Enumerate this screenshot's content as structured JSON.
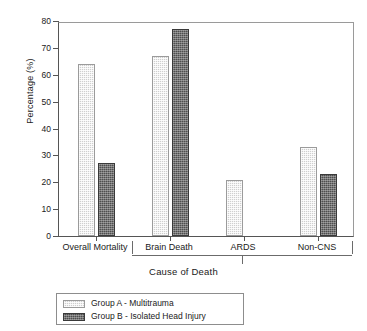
{
  "chart_data": {
    "type": "bar",
    "title": "",
    "xlabel": "Cause of Death",
    "ylabel": "Percentage (%)",
    "ylim": [
      0,
      80
    ],
    "ytick_step": 10,
    "yticks": [
      0,
      10,
      20,
      30,
      40,
      50,
      60,
      70,
      80
    ],
    "grid": false,
    "legend_position": "below-left",
    "categories": [
      "Overall Mortality",
      "Brain Death",
      "ARDS",
      "Non-CNS"
    ],
    "series": [
      {
        "name": "Group A - Multitrauma",
        "key": "groupA",
        "swatch": "light-gray-stipple",
        "color": "#cfcfcf",
        "values": [
          64,
          67,
          21,
          33
        ]
      },
      {
        "name": "Group B - Isolated Head Injury",
        "key": "groupB",
        "swatch": "dark-gray-stipple",
        "color": "#4e4e4e",
        "values": [
          27,
          77,
          null,
          23
        ]
      }
    ],
    "axis_bracket": {
      "spans": [
        "Brain Death",
        "ARDS",
        "Non-CNS"
      ],
      "points_to": "Cause of Death"
    }
  },
  "legend": {
    "entries": [
      {
        "label": "Group A - Multitrauma"
      },
      {
        "label": "Group B - Isolated Head Injury"
      }
    ]
  }
}
